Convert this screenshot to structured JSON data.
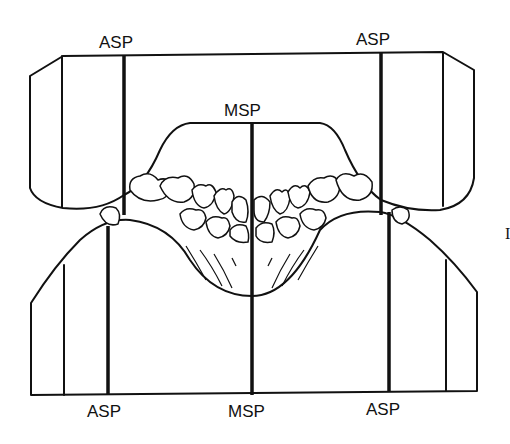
{
  "diagram": {
    "type": "dental arch occlusal plane diagram",
    "labels": {
      "asp_top_left": "ASP",
      "asp_top_right": "ASP",
      "msp_top": "MSP",
      "asp_bottom_left": "ASP",
      "msp_bottom": "MSP",
      "asp_bottom_right": "ASP",
      "side_mark": "I"
    },
    "colors": {
      "line": "#111111",
      "background": "#ffffff"
    }
  }
}
